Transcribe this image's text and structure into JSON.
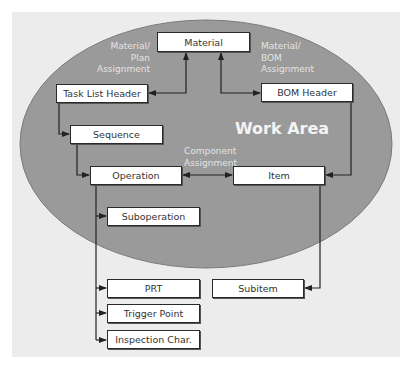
{
  "diagram": {
    "title": "Work Area",
    "colors": {
      "panel_bg": "#ececec",
      "ellipse_fill": "#9a9a9a",
      "ellipse_stroke": "#7a7a7a",
      "box_fill": "#ffffff",
      "box_border": "#2a2a2a",
      "connector": "#222222",
      "label_text": "#e4e4e4"
    },
    "nodes": {
      "material": "Material",
      "task_list_header": "Task List Header",
      "bom_header": "BOM Header",
      "sequence": "Sequence",
      "operation": "Operation",
      "item": "Item",
      "suboperation": "Suboperation",
      "prt": "PRT",
      "subitem": "Subitem",
      "trigger_point": "Trigger Point",
      "inspection_char": "Inspection Char."
    },
    "labels": {
      "material_plan_assignment": "Material/\nPlan\nAssignment",
      "material_bom_assignment": "Material/\nBOM\nAssignment",
      "component_assignment": "Component\nAssignment"
    },
    "edges": [
      {
        "from": "Material",
        "to": "Task List Header",
        "label": "Material/ Plan Assignment",
        "bidirectional": true
      },
      {
        "from": "Material",
        "to": "BOM Header",
        "label": "Material/ BOM Assignment",
        "bidirectional": true
      },
      {
        "from": "Task List Header",
        "to": "Sequence"
      },
      {
        "from": "Sequence",
        "to": "Operation"
      },
      {
        "from": "Operation",
        "to": "Item",
        "label": "Component Assignment",
        "bidirectional": true
      },
      {
        "from": "BOM Header",
        "to": "Item"
      },
      {
        "from": "Operation",
        "to": "Suboperation"
      },
      {
        "from": "Operation",
        "to": "PRT"
      },
      {
        "from": "Operation",
        "to": "Trigger Point"
      },
      {
        "from": "Operation",
        "to": "Inspection Char."
      },
      {
        "from": "Item",
        "to": "Subitem"
      }
    ]
  }
}
